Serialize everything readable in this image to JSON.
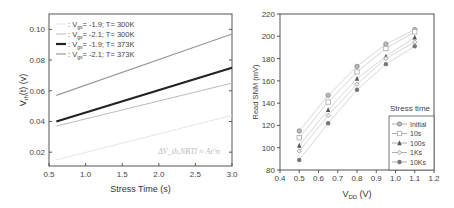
{
  "chart_data": [
    {
      "type": "line",
      "title": "",
      "xlabel": "Stress Time (s)",
      "ylabel": "V_th(t) (v)",
      "xlim": [
        0.5,
        3.0
      ],
      "ylim": [
        0.011,
        0.11
      ],
      "xticks": [
        "0.5",
        "1.0",
        "1.5",
        "2.0",
        "2.5",
        "3.0"
      ],
      "yticks": [
        "0.02",
        "0.04",
        "0.06",
        "0.08",
        "0.10"
      ],
      "annotation": "ΔV_th,NBTI ≈ At^n",
      "legend_position": "upper left",
      "series": [
        {
          "name": ": Vgs= -1.9; T= 300K",
          "color": "#e6e6e6",
          "width": 1,
          "x": [
            0.6,
            3.0
          ],
          "values": [
            0.015,
            0.044
          ]
        },
        {
          "name": ": Vgs= -2.1; T= 300K",
          "color": "#bbbbbb",
          "width": 1,
          "x": [
            0.6,
            3.0
          ],
          "values": [
            0.037,
            0.065
          ]
        },
        {
          "name": ": Vgs= -1.9; T= 373K",
          "color": "#222222",
          "width": 2.2,
          "x": [
            0.6,
            3.0
          ],
          "values": [
            0.04,
            0.075
          ]
        },
        {
          "name": ": Vgs= -2.1; T= 373K",
          "color": "#999999",
          "width": 1.2,
          "x": [
            0.6,
            3.0
          ],
          "values": [
            0.057,
            0.097
          ]
        }
      ]
    },
    {
      "type": "line",
      "title": "",
      "xlabel": "VDD (V)",
      "ylabel": "Read SNM (mV)",
      "xlim": [
        0.4,
        1.2
      ],
      "ylim": [
        80,
        220
      ],
      "xticks": [
        "0.4",
        "0.5",
        "0.6",
        "0.7",
        "0.8",
        "0.9",
        "1.0",
        "1.1",
        "1.2"
      ],
      "yticks": [
        "80",
        "100",
        "120",
        "140",
        "160",
        "180",
        "200",
        "220"
      ],
      "legend_title": "Stress time",
      "legend_position": "lower right",
      "categories": [
        0.5,
        0.65,
        0.8,
        0.95,
        1.1
      ],
      "series": [
        {
          "name": "Initial",
          "marker": "circle",
          "color": "#888888",
          "values": [
            115,
            147,
            173,
            193,
            206
          ]
        },
        {
          "name": "10s",
          "marker": "square-open",
          "color": "#aaaaaa",
          "values": [
            109,
            141,
            168,
            189,
            204
          ]
        },
        {
          "name": "100s",
          "marker": "triangle",
          "color": "#555555",
          "values": [
            102,
            134,
            162,
            182,
            199
          ]
        },
        {
          "name": "1Ks",
          "marker": "diamond-open",
          "color": "#999999",
          "values": [
            97,
            129,
            157,
            180,
            195
          ]
        },
        {
          "name": "10Ks",
          "marker": "circle-filled",
          "color": "#777777",
          "values": [
            89,
            122,
            152,
            175,
            191
          ]
        }
      ]
    }
  ]
}
